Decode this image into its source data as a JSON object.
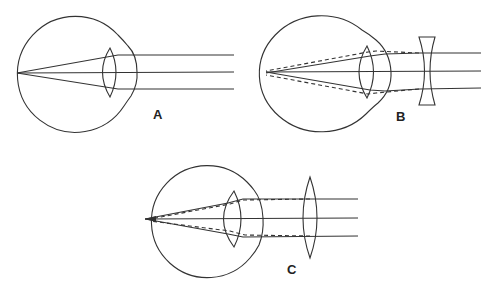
{
  "diagram": {
    "type": "eye-optics-refraction",
    "panels": [
      {
        "id": "A",
        "label": "A",
        "description": "Emmetropic eye: parallel rays focus on retina"
      },
      {
        "id": "B",
        "label": "B",
        "description": "Myopic eye corrected with concave (diverging) lens",
        "corrective_lens": "concave"
      },
      {
        "id": "C",
        "label": "C",
        "description": "Hyperopic eye corrected with convex (converging) lens",
        "corrective_lens": "convex"
      }
    ],
    "colors": {
      "stroke": "#333333",
      "background": "#ffffff"
    }
  }
}
